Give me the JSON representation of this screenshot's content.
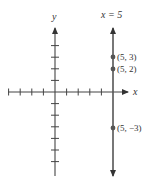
{
  "chart_data": {
    "type": "scatter",
    "title": "",
    "xlabel": "x",
    "ylabel": "y",
    "xlim": [
      -4,
      6
    ],
    "ylim": [
      -7,
      5
    ],
    "grid": false,
    "legend": null,
    "x_ticks": [
      -4,
      -3,
      -2,
      -1,
      1,
      2,
      3,
      4
    ],
    "y_ticks": [
      4,
      3,
      2,
      1,
      -1,
      -2,
      -3,
      -4,
      -5,
      -6
    ],
    "vertical_line": {
      "x": 5,
      "label": "x = 5"
    },
    "points": [
      {
        "x": 5,
        "y": 3,
        "label": "(5, 3)"
      },
      {
        "x": 5,
        "y": 2,
        "label": "(5, 2)"
      },
      {
        "x": 5,
        "y": -3,
        "label": "(5, −3)"
      }
    ],
    "series": [
      {
        "name": "points on x = 5",
        "x": [
          5,
          5,
          5
        ],
        "y": [
          3,
          2,
          -3
        ]
      }
    ]
  },
  "labels": {
    "x_axis": "x",
    "y_axis": "y",
    "line": "x = 5",
    "p1": "(5, 3)",
    "p2": "(5, 2)",
    "p3": "(5, −3)"
  }
}
